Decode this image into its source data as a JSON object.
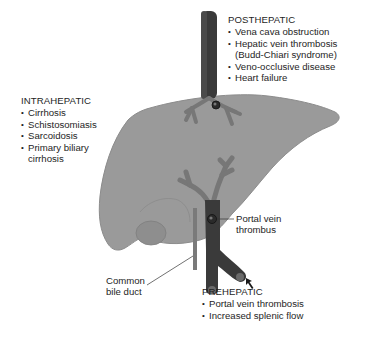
{
  "diagram": {
    "colors": {
      "liver": "#9a9a9a",
      "liver_outline": "#8a8a8a",
      "vessel_light": "#777777",
      "vessel_dark": "#3a3a3a",
      "text": "#1e1e1e",
      "background": "#ffffff"
    },
    "sections": {
      "posthepatic": {
        "heading": "POSTHEPATIC",
        "items": [
          "Vena cava obstruction",
          "Hepatic vein thrombosis",
          "(Budd-Chiari syndrome)",
          "Veno-occlusive disease",
          "Heart failure"
        ]
      },
      "intrahepatic": {
        "heading": "INTRAHEPATIC",
        "items": [
          "Cirrhosis",
          "Schistosomiasis",
          "Sarcoidosis",
          "Primary biliary",
          "cirrhosis"
        ]
      },
      "prehepatic": {
        "heading": "PREHEPATIC",
        "items": [
          "Portal vein thrombosis",
          "Increased splenic flow"
        ]
      }
    },
    "callouts": {
      "portal_vein_thrombus": [
        "Portal vein",
        "thrombus"
      ],
      "common_bile_duct": [
        "Common",
        "bile duct"
      ]
    },
    "icons": {
      "arrow": "arrow-up-left-icon"
    }
  }
}
